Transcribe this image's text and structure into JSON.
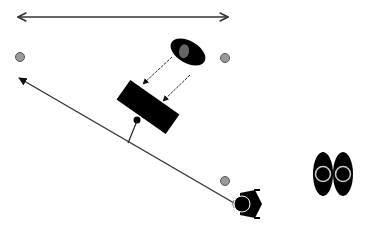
{
  "diagram": {
    "type": "lighting-setup-top-view",
    "colors": {
      "background": "#ffffff",
      "line": "#333333",
      "object": "#000000",
      "marker": "#999999",
      "marker_stroke": "#555555",
      "light_inner": "#666666",
      "eye_ring": "#cccccc"
    },
    "elements": [
      {
        "id": "width-arrow",
        "kind": "double-arrow",
        "from": [
          17,
          17
        ],
        "to": [
          229,
          17
        ]
      },
      {
        "id": "marker-top-left",
        "kind": "marker",
        "center": [
          20,
          57
        ]
      },
      {
        "id": "marker-top-right",
        "kind": "marker",
        "center": [
          225,
          58
        ]
      },
      {
        "id": "marker-bottom-right",
        "kind": "marker",
        "center": [
          225,
          181
        ]
      },
      {
        "id": "light-source",
        "kind": "ellipse-light",
        "center": [
          188,
          52
        ]
      },
      {
        "id": "reflector",
        "kind": "rectangle-panel",
        "center": [
          148,
          107
        ]
      },
      {
        "id": "light-ray-1",
        "kind": "arrow",
        "from": [
          172,
          57
        ],
        "to": [
          142,
          84
        ]
      },
      {
        "id": "light-ray-2",
        "kind": "arrow",
        "from": [
          190,
          75
        ],
        "to": [
          162,
          101
        ]
      },
      {
        "id": "sight-line",
        "kind": "arrow",
        "from": [
          233,
          202
        ],
        "to": [
          17,
          77
        ]
      },
      {
        "id": "panel-stand",
        "kind": "line",
        "from": [
          137,
          120
        ],
        "to": [
          128,
          143
        ]
      },
      {
        "id": "person",
        "kind": "person-top-view",
        "center": [
          246,
          204
        ]
      },
      {
        "id": "viewer-eyes",
        "kind": "eyes",
        "center": [
          332,
          174
        ]
      }
    ]
  }
}
